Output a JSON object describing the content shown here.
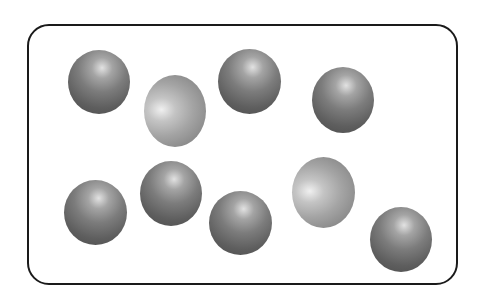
{
  "diagram": {
    "container": {
      "shape": "rounded-rectangle",
      "border_color": "#1a1a1a"
    },
    "particle_types": {
      "dark": {
        "color": "#6e6e6e",
        "count": 7
      },
      "light": {
        "color": "#a8a8a8",
        "count": 2
      }
    },
    "particles": [
      {
        "id": 1,
        "type": "dark",
        "x": 68,
        "y": 50,
        "w": 62,
        "h": 64
      },
      {
        "id": 2,
        "type": "light",
        "x": 144,
        "y": 75,
        "w": 62,
        "h": 72
      },
      {
        "id": 3,
        "type": "dark",
        "x": 218,
        "y": 49,
        "w": 63,
        "h": 65
      },
      {
        "id": 4,
        "type": "dark",
        "x": 312,
        "y": 67,
        "w": 62,
        "h": 66
      },
      {
        "id": 5,
        "type": "dark",
        "x": 64,
        "y": 180,
        "w": 63,
        "h": 65
      },
      {
        "id": 6,
        "type": "dark",
        "x": 140,
        "y": 161,
        "w": 62,
        "h": 65
      },
      {
        "id": 7,
        "type": "dark",
        "x": 209,
        "y": 191,
        "w": 63,
        "h": 64
      },
      {
        "id": 8,
        "type": "light",
        "x": 292,
        "y": 157,
        "w": 63,
        "h": 71
      },
      {
        "id": 9,
        "type": "dark",
        "x": 370,
        "y": 207,
        "w": 62,
        "h": 65
      }
    ]
  }
}
